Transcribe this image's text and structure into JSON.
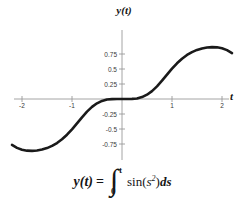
{
  "figure": {
    "axis_title_y": "y(t)",
    "axis_title_x": "t",
    "curve_color": "#1a1a1a",
    "axis_color": "#9a9a9a",
    "background": "#ffffff"
  },
  "formula": {
    "lhs": "y(t)",
    "equals": "=",
    "integral_sign": "∫",
    "limit_lower": "0",
    "limit_upper": "t",
    "function": "sin(",
    "integrand_var": "s",
    "integrand_exponent": "2",
    "close_paren": ")",
    "differential": "ds",
    "plain_text": "y(t) = ∫₀ᵗ sin(s²)ds"
  },
  "chart_data": {
    "type": "line",
    "title": "y(t)",
    "xlabel": "t",
    "ylabel": "y(t)",
    "xlim": [
      -2.2,
      2.2
    ],
    "ylim": [
      -0.95,
      0.95
    ],
    "grid": false,
    "legend": null,
    "xticks": [
      -2,
      -1,
      1,
      2
    ],
    "xtick_labels": [
      "-2",
      "-1",
      "1",
      "2"
    ],
    "yticks": [
      0.75,
      0.5,
      0.25,
      -0.25,
      -0.5,
      -0.75
    ],
    "ytick_labels": [
      "0.75",
      "0.5",
      "0.25",
      "-0.25",
      "-0.5",
      "-0.75"
    ],
    "series": [
      {
        "name": "y(t) = Fresnel S-like integral of sin(s^2)",
        "x": [
          -2.2,
          -2.1,
          -2.0,
          -1.9,
          -1.8,
          -1.7,
          -1.6,
          -1.5,
          -1.4,
          -1.3,
          -1.2,
          -1.1,
          -1.0,
          -0.9,
          -0.8,
          -0.7,
          -0.6,
          -0.5,
          -0.4,
          -0.3,
          -0.2,
          -0.1,
          0.0,
          0.1,
          0.2,
          0.3,
          0.4,
          0.5,
          0.6,
          0.7,
          0.8,
          0.9,
          1.0,
          1.1,
          1.2,
          1.3,
          1.4,
          1.5,
          1.6,
          1.7,
          1.8,
          1.9,
          2.0,
          2.1,
          2.2
        ],
        "y": [
          -0.766,
          -0.815,
          -0.845,
          -0.861,
          -0.865,
          -0.859,
          -0.843,
          -0.818,
          -0.782,
          -0.734,
          -0.672,
          -0.595,
          -0.505,
          -0.406,
          -0.305,
          -0.211,
          -0.132,
          -0.072,
          -0.032,
          -0.009,
          -0.0027,
          -0.00033,
          0.0,
          0.00033,
          0.0027,
          0.009,
          0.032,
          0.072,
          0.132,
          0.211,
          0.305,
          0.406,
          0.505,
          0.595,
          0.672,
          0.734,
          0.782,
          0.818,
          0.843,
          0.859,
          0.865,
          0.861,
          0.845,
          0.815,
          0.766
        ]
      }
    ]
  }
}
